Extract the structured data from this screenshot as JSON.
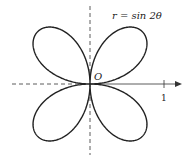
{
  "diagram": {
    "type": "polar-rose",
    "equation_label": "r = sin 2θ",
    "origin_label": "O",
    "tick_label": "1",
    "curve": {
      "k": 2,
      "amplitude": 1,
      "petals": 4
    },
    "colors": {
      "curve": "#222222",
      "axis": "#333333",
      "background": "#ffffff"
    },
    "origin_px": [
      90,
      84
    ],
    "scale_px_per_unit": 74
  }
}
